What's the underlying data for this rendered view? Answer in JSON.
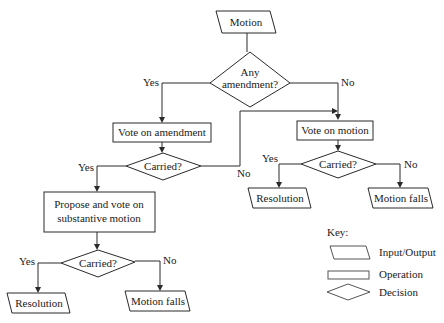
{
  "diagram": {
    "type": "flowchart",
    "nodes": {
      "start": {
        "shape": "input-output",
        "label": "Motion"
      },
      "any_amendment": {
        "shape": "decision",
        "label_line1": "Any",
        "label_line2": "amendment?"
      },
      "vote_amendment": {
        "shape": "operation",
        "label": "Vote on amendment"
      },
      "carried_amendment": {
        "shape": "decision",
        "label": "Carried?"
      },
      "vote_motion": {
        "shape": "operation",
        "label": "Vote on motion"
      },
      "carried_motion": {
        "shape": "decision",
        "label": "Carried?"
      },
      "resolution_right": {
        "shape": "input-output",
        "label": "Resolution"
      },
      "motion_falls_right": {
        "shape": "input-output",
        "label": "Motion falls"
      },
      "propose_substantive": {
        "shape": "operation",
        "label_line1": "Propose and vote on",
        "label_line2": "substantive motion"
      },
      "carried_substantive": {
        "shape": "decision",
        "label": "Carried?"
      },
      "resolution_left": {
        "shape": "input-output",
        "label": "Resolution"
      },
      "motion_falls_left": {
        "shape": "input-output",
        "label": "Motion falls"
      }
    },
    "edge_labels": {
      "any_amendment_yes": "Yes",
      "any_amendment_no": "No",
      "carried_amendment_yes": "Yes",
      "carried_amendment_no": "No",
      "carried_motion_yes": "Yes",
      "carried_motion_no": "No",
      "carried_substantive_yes": "Yes",
      "carried_substantive_no": "No"
    },
    "edges": [
      {
        "from": "start",
        "to": "any_amendment"
      },
      {
        "from": "any_amendment",
        "to": "vote_amendment",
        "label": "Yes"
      },
      {
        "from": "any_amendment",
        "to": "vote_motion",
        "label": "No"
      },
      {
        "from": "vote_amendment",
        "to": "carried_amendment"
      },
      {
        "from": "carried_amendment",
        "to": "propose_substantive",
        "label": "Yes"
      },
      {
        "from": "carried_amendment",
        "to": "vote_motion",
        "label": "No"
      },
      {
        "from": "vote_motion",
        "to": "carried_motion"
      },
      {
        "from": "carried_motion",
        "to": "resolution_right",
        "label": "Yes"
      },
      {
        "from": "carried_motion",
        "to": "motion_falls_right",
        "label": "No"
      },
      {
        "from": "propose_substantive",
        "to": "carried_substantive"
      },
      {
        "from": "carried_substantive",
        "to": "resolution_left",
        "label": "Yes"
      },
      {
        "from": "carried_substantive",
        "to": "motion_falls_left",
        "label": "No"
      }
    ]
  },
  "legend": {
    "title": "Key:",
    "items": [
      {
        "shape": "input-output",
        "label": "Input/Output"
      },
      {
        "shape": "operation",
        "label": "Operation"
      },
      {
        "shape": "decision",
        "label": "Decision"
      }
    ]
  }
}
